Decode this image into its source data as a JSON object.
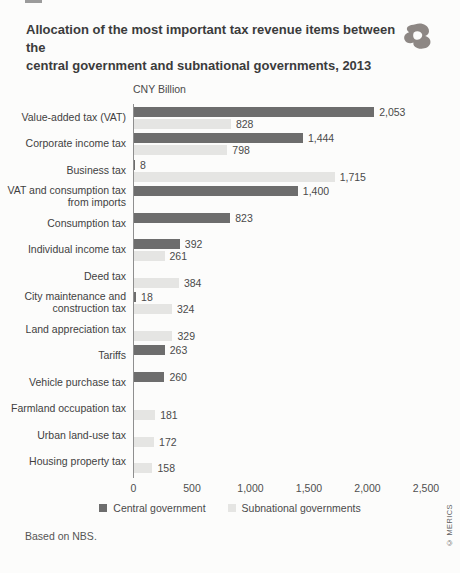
{
  "header": {
    "title_line1": "Allocation of the most important tax revenue items between the",
    "title_line2": "central government and subnational governments, 2013"
  },
  "chart_data": {
    "type": "bar",
    "orientation": "horizontal",
    "title": "Allocation of the most important tax revenue items between the central government and subnational governments, 2013",
    "unit_label": "CNY Billion",
    "xlim": [
      0,
      2500
    ],
    "x_ticks": [
      "0",
      "500",
      "1,000",
      "1,500",
      "2,000",
      "2,500"
    ],
    "legend_position": "bottom",
    "series_names": [
      "Central government",
      "Subnational governments"
    ],
    "categories": [
      {
        "label": "Value-added tax (VAT)",
        "central": 2053,
        "subnational": 828
      },
      {
        "label": "Corporate income tax",
        "central": 1444,
        "subnational": 798
      },
      {
        "label": "Business tax",
        "central": 8,
        "subnational": 1715
      },
      {
        "label": "VAT and consumption tax\nfrom imports",
        "central": 1400,
        "subnational": null
      },
      {
        "label": "Consumption tax",
        "central": 823,
        "subnational": null
      },
      {
        "label": "Individual income tax",
        "central": 392,
        "subnational": 261
      },
      {
        "label": "Deed tax",
        "central": null,
        "subnational": 384
      },
      {
        "label": "City maintenance and\nconstruction tax",
        "central": 18,
        "subnational": 324
      },
      {
        "label": "Land appreciation tax",
        "central": null,
        "subnational": 329
      },
      {
        "label": "Tariffs",
        "central": 263,
        "subnational": null
      },
      {
        "label": "Vehicle purchase tax",
        "central": 260,
        "subnational": null
      },
      {
        "label": "Farmland occupation tax",
        "central": null,
        "subnational": 181
      },
      {
        "label": "Urban land-use tax",
        "central": null,
        "subnational": 172
      },
      {
        "label": "Housing property tax",
        "central": null,
        "subnational": 158
      }
    ]
  },
  "colors": {
    "central_bar": "#6d6d6d",
    "subnational_bar": "#e5e5e3",
    "axis_line": "#8f8f8f",
    "title_text": "#3b3b3b",
    "body_text": "#4a4a4a",
    "background": "#fcfcfb",
    "logo_gray": "#8d8784"
  },
  "footer": {
    "source": "Based on NBS.",
    "copyright": "© MERICS"
  }
}
